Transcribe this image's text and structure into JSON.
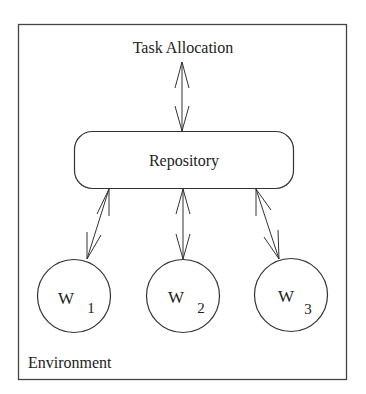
{
  "diagram": {
    "title_node": {
      "label": "Task Allocation"
    },
    "repository": {
      "label": "Repository"
    },
    "workers": [
      {
        "letter": "W",
        "sub": "1"
      },
      {
        "letter": "W",
        "sub": "2"
      },
      {
        "letter": "W",
        "sub": "3"
      }
    ],
    "environment": {
      "label": "Environment"
    },
    "colors": {
      "stroke": "#333333",
      "background": "#ffffff"
    }
  }
}
